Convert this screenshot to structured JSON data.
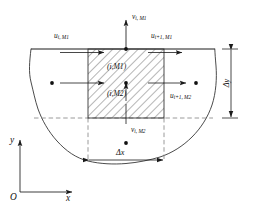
{
  "figure": {
    "type": "staggered-grid-control-volume-diagram",
    "background_color": "#ffffff",
    "line_color": "#1a1a1a",
    "hatch_color": "#5a5a5a",
    "dash_color": "#707070"
  },
  "velocity_labels": {
    "v_top": {
      "sym": "v",
      "sub": "i, M1"
    },
    "u_top_left": {
      "sym": "u",
      "sub": "i, M1"
    },
    "u_top_right": {
      "sym": "u",
      "sub": "i+1, M1"
    },
    "u_mid_right": {
      "sym": "u",
      "sub": "i+1, M2"
    },
    "v_bottom": {
      "sym": "v",
      "sub": "i, M2"
    }
  },
  "cell_labels": {
    "upper": "(i,M1)",
    "lower": "(i,M2)"
  },
  "dimensions": {
    "dx": "Δx",
    "dy": "Δy"
  },
  "axes": {
    "origin": "O",
    "x": "x",
    "y": "y"
  },
  "geometry": {
    "cell_left_x": 88,
    "cell_right_x": 164,
    "cell_top_y": 49,
    "cell_mid_y": 83,
    "cell_bottom_y": 118,
    "free_surface_y": 49,
    "dot_radius": 1.9
  }
}
